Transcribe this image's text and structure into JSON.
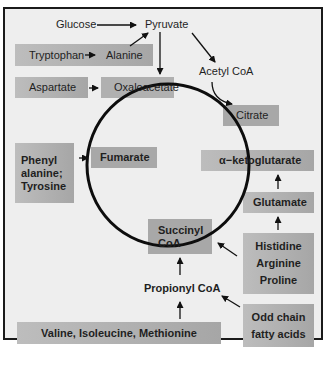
{
  "diagram": {
    "nodes": {
      "glucose": "Glucose",
      "pyruvate": "Pyruvate",
      "tryptophan": "Tryptophan",
      "alanine": "Alanine",
      "aspartate": "Aspartate",
      "oxaloacetate": "Oxaloacetate",
      "acetyl_coa": "Acetyl CoA",
      "citrate": "Citrate",
      "phenylalanine_line1": "Phenyl",
      "phenylalanine_line2": "alanine;",
      "tyrosine": "Tyrosine",
      "fumarate": "Fumarate",
      "alpha_ketoglutarate": "α−ketoglutarate",
      "glutamate": "Glutamate",
      "succinyl_line1": "Succinyl",
      "succinyl_line2": "CoA",
      "histidine": "Histidine",
      "arginine": "Arginine",
      "proline": "Proline",
      "propionyl_coa": "Propionyl CoA",
      "odd_chain_line1": "Odd chain",
      "odd_chain_line2": "fatty acids",
      "valine_group": "Valine, Isoleucine, Methionine"
    },
    "edges": [
      [
        "Glucose",
        "Pyruvate"
      ],
      [
        "Tryptophan",
        "Alanine"
      ],
      [
        "Alanine",
        "Pyruvate"
      ],
      [
        "Pyruvate",
        "Oxaloacetate"
      ],
      [
        "Pyruvate",
        "Acetyl CoA"
      ],
      [
        "Acetyl CoA",
        "Citrate"
      ],
      [
        "Aspartate",
        "Oxaloacetate"
      ],
      [
        "Phenylalanine; Tyrosine",
        "Fumarate"
      ],
      [
        "Glutamate",
        "α−ketoglutarate"
      ],
      [
        "Histidine, Arginine, Proline",
        "Glutamate"
      ],
      [
        "Histidine, Arginine, Proline",
        "Succinyl CoA"
      ],
      [
        "Propionyl CoA",
        "Succinyl CoA"
      ],
      [
        "Valine, Isoleucine, Methionine",
        "Propionyl CoA"
      ],
      [
        "Odd chain fatty acids",
        "Propionyl CoA"
      ]
    ],
    "colors": {
      "background": "#eeeeee",
      "box": "#b0b0b0",
      "line": "#111111"
    }
  }
}
